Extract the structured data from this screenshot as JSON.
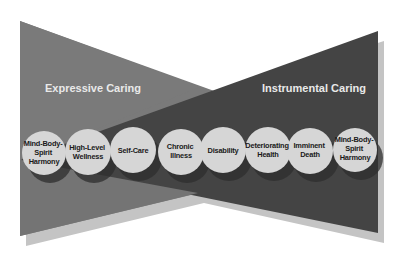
{
  "diagram": {
    "left_wedge": {
      "label": "Expressive Caring",
      "color": "#7a7a7a"
    },
    "right_wedge": {
      "label": "Instrumental Caring",
      "color": "#444444"
    },
    "shadow_color": "#c4c4c4",
    "circle_fill": "#d6d6d6",
    "circle_shadow": "#2e2e2e",
    "stages": [
      {
        "lines": [
          "Mind-Body-",
          "Spirit",
          "Harmony"
        ]
      },
      {
        "lines": [
          "High-Level",
          "Wellness"
        ]
      },
      {
        "lines": [
          "Self-Care"
        ]
      },
      {
        "lines": [
          "Chronic",
          "Illness"
        ]
      },
      {
        "lines": [
          "Disability"
        ]
      },
      {
        "lines": [
          "Deteriorating",
          "Health"
        ]
      },
      {
        "lines": [
          "Imminent",
          "Death"
        ]
      },
      {
        "lines": [
          "Mind-Body-",
          "Spirit",
          "Harmony"
        ]
      }
    ]
  }
}
